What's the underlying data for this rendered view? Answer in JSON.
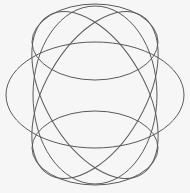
{
  "diagram": {
    "title": "",
    "stroke_color": "#5a5a5a",
    "background": "#f6f6f6",
    "shapes": [
      {
        "name": "top-ellipse",
        "cx": 95,
        "cy": 42,
        "rx": 63,
        "ry": 38,
        "rotate": 0
      },
      {
        "name": "bottom-ellipse",
        "cx": 95,
        "cy": 148,
        "rx": 63,
        "ry": 37,
        "rotate": 0
      },
      {
        "name": "middle-wide-ellipse",
        "cx": 95,
        "cy": 95,
        "rx": 89,
        "ry": 53,
        "rotate": 0
      },
      {
        "name": "tall-ellipse",
        "cx": 95,
        "cy": 95,
        "rx": 62,
        "ry": 89,
        "rotate": 0
      },
      {
        "name": "tilted-ellipse-left",
        "cx": 95,
        "cy": 95,
        "rx": 50,
        "ry": 92,
        "rotate": -30
      },
      {
        "name": "tilted-ellipse-right",
        "cx": 95,
        "cy": 95,
        "rx": 50,
        "ry": 92,
        "rotate": 30
      }
    ]
  }
}
